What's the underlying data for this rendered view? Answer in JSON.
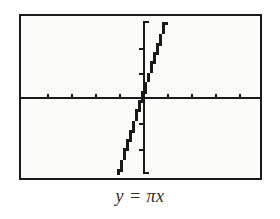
{
  "figure": {
    "type": "graphing-calculator-screen",
    "caption": "y = πx",
    "caption_parts": {
      "lhs": "y",
      "equals": "=",
      "coefficient": "π",
      "variable": "x"
    },
    "background_color": "#fbfbfa",
    "frame_color": "#1a1a1a",
    "curve_color": "#1a1a1a",
    "axis_color": "#1a1a1a"
  },
  "chart_data": {
    "type": "line",
    "title": "",
    "subtitle": "",
    "xlabel": "",
    "ylabel": "",
    "equation": "y = πx",
    "slope": 3.14159,
    "intercept": 0,
    "xlim": [
      -4.7,
      4.7
    ],
    "ylim": [
      -3.1,
      3.1
    ],
    "x_tick_step": 1,
    "y_tick_step": 1,
    "x_ticks": [
      -4,
      -3,
      -2,
      -1,
      0,
      1,
      2,
      3,
      4
    ],
    "y_ticks": [
      -2,
      -1,
      0,
      1,
      2
    ],
    "tick_labels_shown": false,
    "grid": false,
    "legend": false,
    "axes_through_origin": true,
    "render_style": "pixelated-stairstep",
    "x": [
      -1.0,
      -0.9,
      -0.8,
      -0.7,
      -0.6,
      -0.5,
      -0.4,
      -0.3,
      -0.2,
      -0.1,
      0.0,
      0.1,
      0.2,
      0.3,
      0.4,
      0.5,
      0.6,
      0.7,
      0.8,
      0.9,
      1.0
    ],
    "values": [
      -3.14,
      -2.83,
      -2.51,
      -2.2,
      -1.88,
      -1.57,
      -1.26,
      -0.94,
      -0.63,
      -0.31,
      0.0,
      0.31,
      0.63,
      0.94,
      1.26,
      1.57,
      1.88,
      2.2,
      2.51,
      2.83,
      3.14
    ],
    "series": [
      {
        "name": "y = πx",
        "values": [
          -3.14,
          -2.83,
          -2.51,
          -2.2,
          -1.88,
          -1.57,
          -1.26,
          -0.94,
          -0.63,
          -0.31,
          0.0,
          0.31,
          0.63,
          0.94,
          1.26,
          1.57,
          1.88,
          2.2,
          2.51,
          2.83,
          3.14
        ]
      }
    ]
  }
}
